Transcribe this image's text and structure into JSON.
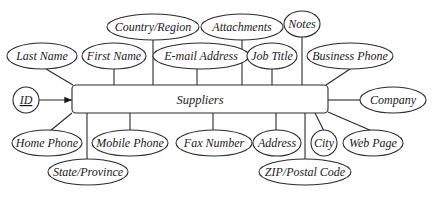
{
  "diagram": {
    "type": "entity-attribute (ER) diagram",
    "entity": {
      "name": "Suppliers"
    },
    "primary_key": {
      "name": "ID",
      "underlined": true
    },
    "attributes": {
      "top_row_upper": [
        "Country/Region",
        "Attachments",
        "Notes"
      ],
      "top_row_lower": [
        "Last Name",
        "First Name",
        "E-mail Address",
        "Job Title",
        "Business Phone"
      ],
      "right": [
        "Company"
      ],
      "bottom_row_upper": [
        "Home Phone",
        "Mobile Phone",
        "Fax Number",
        "Address",
        "City",
        "Web Page"
      ],
      "bottom_row_lower": [
        "State/Province",
        "ZIP/Postal Code"
      ]
    },
    "labels": {
      "entity": "Suppliers",
      "id": "ID",
      "country_region": "Country/Region",
      "attachments": "Attachments",
      "notes": "Notes",
      "last_name": "Last Name",
      "first_name": "First Name",
      "email_address": "E-mail Address",
      "job_title": "Job Title",
      "business_phone": "Business Phone",
      "company": "Company",
      "home_phone": "Home Phone",
      "mobile_phone": "Mobile Phone",
      "fax_number": "Fax Number",
      "address": "Address",
      "city": "City",
      "web_page": "Web Page",
      "state_province": "State/Province",
      "zip_postal_code": "ZIP/Postal Code"
    },
    "colors": {
      "stroke": "#2a2a2a",
      "background": "#ffffff",
      "text": "#1a1a1a"
    }
  }
}
